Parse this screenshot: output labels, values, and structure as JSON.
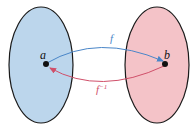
{
  "diagram": {
    "type": "function-mapping",
    "left_set": {
      "fill": "#bcd6ec",
      "stroke": "#1a1a1a",
      "point_label": "a"
    },
    "right_set": {
      "fill": "#f4c3c8",
      "stroke": "#1a1a1a",
      "point_label": "b"
    },
    "forward_arrow": {
      "label": "f",
      "color": "#4a86c8"
    },
    "inverse_arrow": {
      "label": "f",
      "superscript": "−1",
      "color": "#d0506a"
    }
  }
}
